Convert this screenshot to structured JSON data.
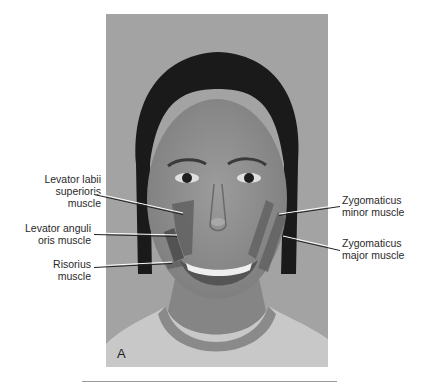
{
  "figure": {
    "panel_letter": "A",
    "photo_description": "Frontal photograph of smiling woman with muscle overlays"
  },
  "labels": {
    "left": [
      {
        "id": "levator-labii-superioris",
        "lines": [
          "Levator labii",
          "superioris",
          "muscle"
        ]
      },
      {
        "id": "levator-anguli-oris",
        "lines": [
          "Levator anguli",
          "oris muscle"
        ]
      },
      {
        "id": "risorius",
        "lines": [
          "Risorius",
          "muscle"
        ]
      }
    ],
    "right": [
      {
        "id": "zygomaticus-minor",
        "lines": [
          "Zygomaticus",
          "minor muscle"
        ]
      },
      {
        "id": "zygomaticus-major",
        "lines": [
          "Zygomaticus",
          "major muscle"
        ]
      }
    ]
  },
  "colors": {
    "background": "#a3a3a3",
    "muscle_overlay": "#5e5e5e",
    "label_text": "#2a2a2a"
  }
}
